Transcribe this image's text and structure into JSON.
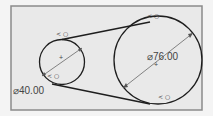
{
  "sketch": {
    "background_color": "#e9e9e9",
    "frame_color": "#8a8a8a",
    "line_color": "#1e1e1e",
    "small_circle": {
      "dimension_label": "⌀40.00",
      "center_mark_label": "+",
      "constraints": [
        "tangent",
        "tangent"
      ]
    },
    "large_circle": {
      "dimension_label": "⌀76.00",
      "center_mark_label": "+",
      "constraints": [
        "tangent",
        "tangent"
      ]
    },
    "constraint_glyph": "< ○",
    "tangent_lines": [
      "upper-tangent-line",
      "lower-tangent-line"
    ]
  }
}
